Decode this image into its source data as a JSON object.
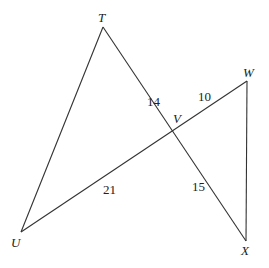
{
  "diagram": {
    "points": {
      "T": {
        "label": "T",
        "x": 103,
        "y": 27
      },
      "W": {
        "label": "W",
        "x": 247,
        "y": 81
      },
      "V": {
        "label": "V",
        "x": 172,
        "y": 119
      },
      "U": {
        "label": "U",
        "x": 21,
        "y": 232
      },
      "X": {
        "label": "X",
        "x": 246,
        "y": 241
      }
    },
    "segments": [
      {
        "from": "T",
        "to": "U"
      },
      {
        "from": "T",
        "to": "X",
        "through": "V"
      },
      {
        "from": "U",
        "to": "W",
        "through": "V"
      },
      {
        "from": "W",
        "to": "X"
      }
    ],
    "lengths": {
      "TV": "14",
      "VW": "10",
      "UV": "21",
      "VX": "15"
    },
    "stroke_color": "#333333"
  }
}
